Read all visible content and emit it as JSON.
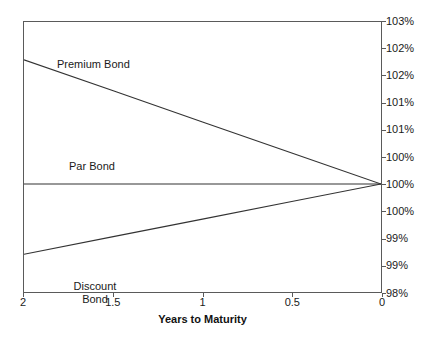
{
  "chart_data": {
    "type": "line",
    "title": "",
    "subtitle": "",
    "xlabel": "Years to Maturity",
    "ylabel": "",
    "x": [
      2,
      1.5,
      1,
      0.5,
      0
    ],
    "xlim": [
      2,
      0
    ],
    "x_axis_reversed": true,
    "x_tick_labels": [
      "2",
      "1.5",
      "1",
      "0.5",
      "0"
    ],
    "ylim": [
      98,
      103
    ],
    "y_ticks": [
      103,
      102.5,
      102,
      101.5,
      101,
      100.5,
      100,
      99.5,
      99,
      98.5,
      98
    ],
    "y_tick_labels": [
      "103%",
      "102%",
      "102%",
      "101%",
      "101%",
      "100%",
      "100%",
      "100%",
      "99%",
      "99%",
      "98%",
      "98%"
    ],
    "y_axis_position": "right",
    "grid": false,
    "legend_position": "inline-annotations",
    "series": [
      {
        "name": "Premium Bond",
        "annotation": "Premium Bond",
        "values": [
          102.3,
          101.725,
          101.15,
          100.575,
          100.0
        ],
        "color": "#333333"
      },
      {
        "name": "Par Bond",
        "annotation": "Par Bond",
        "values": [
          100.0,
          100.0,
          100.0,
          100.0,
          100.0
        ],
        "color": "#333333"
      },
      {
        "name": "Discount Bond",
        "annotation": "Discount Bond",
        "annotation_line1": "Discount",
        "annotation_line2": "Bond",
        "values": [
          98.7,
          99.025,
          99.35,
          99.675,
          100.0
        ],
        "color": "#333333"
      }
    ]
  },
  "axis": {
    "y_labels": [
      {
        "text": "103%",
        "value": 103
      },
      {
        "text": "102%",
        "value": 102.5
      },
      {
        "text": "102%",
        "value": 102
      },
      {
        "text": "101%",
        "value": 101.5
      },
      {
        "text": "101%",
        "value": 101
      },
      {
        "text": "100%",
        "value": 100.5
      },
      {
        "text": "100%",
        "value": 100
      },
      {
        "text": "100%",
        "value": 99.5
      },
      {
        "text": "99%",
        "value": 99
      },
      {
        "text": "99%",
        "value": 98.5
      },
      {
        "text": "98%",
        "value": 98.25
      },
      {
        "text": "98%",
        "value": 98
      }
    ],
    "x_labels": [
      {
        "text": "2",
        "value": 2
      },
      {
        "text": "1.5",
        "value": 1.5
      },
      {
        "text": "1",
        "value": 1
      },
      {
        "text": "0.5",
        "value": 0.5
      },
      {
        "text": "0",
        "value": 0
      }
    ],
    "x_title": "Years to Maturity"
  },
  "annotations": {
    "premium": "Premium Bond",
    "par": "Par Bond",
    "discount_line1": "Discount",
    "discount_line2": "Bond"
  },
  "colors": {
    "line": "#333333",
    "frame": "#5a5a5a",
    "text": "#1a1a1a",
    "background": "#ffffff"
  }
}
